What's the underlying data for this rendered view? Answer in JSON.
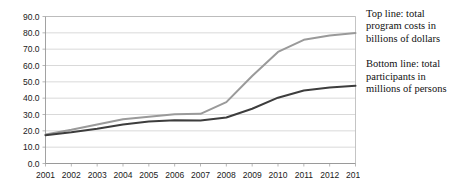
{
  "chart_data": {
    "type": "line",
    "title": "",
    "xlabel": "",
    "ylabel": "",
    "categories": [
      "2001",
      "2002",
      "2003",
      "2004",
      "2005",
      "2006",
      "2007",
      "2008",
      "2009",
      "2010",
      "2011",
      "2012",
      "2013"
    ],
    "x": [
      2001,
      2002,
      2003,
      2004,
      2005,
      2006,
      2007,
      2008,
      2009,
      2010,
      2011,
      2012,
      2013
    ],
    "ylim": [
      0.0,
      90.0
    ],
    "ytick_labels": [
      "0.0",
      "10.0",
      "20.0",
      "30.0",
      "40.0",
      "50.0",
      "60.0",
      "70.0",
      "80.0",
      "90.0"
    ],
    "ytick_values": [
      0,
      10,
      20,
      30,
      40,
      50,
      60,
      70,
      80,
      90
    ],
    "grid": true,
    "legend_position": "right",
    "series": [
      {
        "name": "Top line: total program costs in billions of dollars",
        "short_name": "program-costs",
        "color": "#9a9a9a",
        "values": [
          17.8,
          20.6,
          23.9,
          27.1,
          28.6,
          30.2,
          30.4,
          37.6,
          53.6,
          68.3,
          75.7,
          78.4,
          79.9
        ]
      },
      {
        "name": "Bottom line: total participants in millions of persons",
        "short_name": "total-participants",
        "color": "#3d3d3d",
        "values": [
          17.3,
          19.1,
          21.3,
          23.9,
          25.7,
          26.5,
          26.3,
          28.2,
          33.5,
          40.3,
          44.7,
          46.6,
          47.6
        ]
      }
    ],
    "legend": [
      "Top line: total\nprogram costs in\nbillions of dollars",
      "Bottom line: total\nparticipants in\nmillions of persons"
    ]
  }
}
